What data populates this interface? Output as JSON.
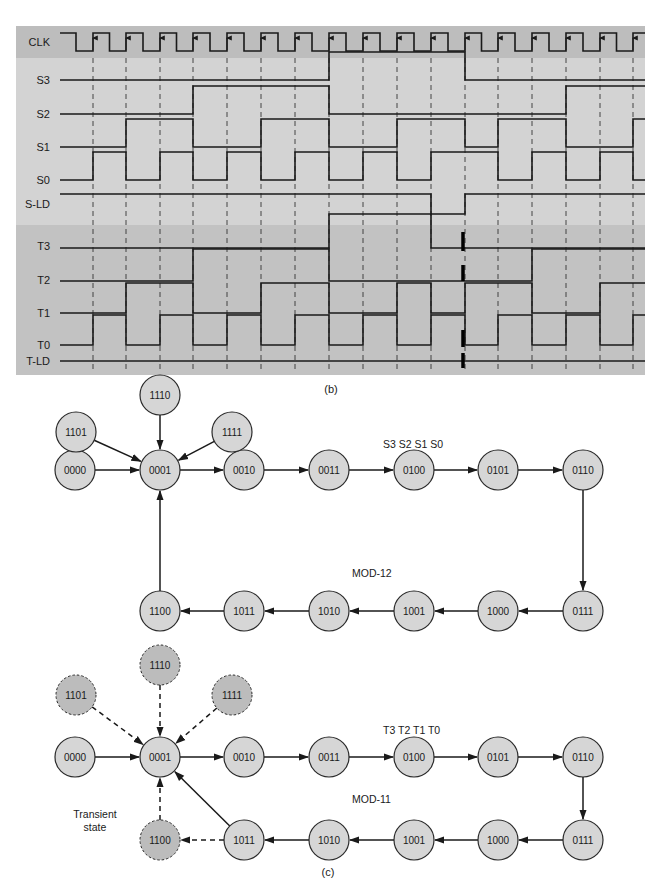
{
  "colors": {
    "clk_band": "#bdbdbd",
    "s_panel": "#d3d3d3",
    "t_panel": "#c2c2c2",
    "waveform": "#1a1a1a",
    "node_fill": "#d6d6d6",
    "invalid_node_fill": "#bcbcbc",
    "node_stroke": "#2a2a2a"
  },
  "timing": {
    "caption": "(b)",
    "clock_edges_x": [
      93,
      126,
      160,
      193,
      227,
      261,
      295,
      329,
      363,
      397,
      431,
      465,
      498,
      532,
      566,
      600,
      633
    ],
    "signals": [
      {
        "name": "CLK",
        "label_y": 42
      },
      {
        "name": "S3",
        "label_y": 80
      },
      {
        "name": "S2",
        "label_y": 114
      },
      {
        "name": "S1",
        "label_y": 147
      },
      {
        "name": "S0",
        "label_y": 180
      },
      {
        "name": "S-LD",
        "label_y": 204
      },
      {
        "name": "T3",
        "label_y": 246
      },
      {
        "name": "T2",
        "label_y": 280
      },
      {
        "name": "T1",
        "label_y": 313
      },
      {
        "name": "T0",
        "label_y": 345
      },
      {
        "name": "T-LD",
        "label_y": 361
      }
    ]
  },
  "diagram_mod12": {
    "header": "S3 S2 S1 S0",
    "label": "MOD-12",
    "nodes": [
      {
        "id": "0000",
        "x": 75,
        "y": 470
      },
      {
        "id": "0001",
        "x": 160,
        "y": 470
      },
      {
        "id": "0010",
        "x": 244,
        "y": 470
      },
      {
        "id": "0011",
        "x": 329,
        "y": 470
      },
      {
        "id": "0100",
        "x": 414,
        "y": 470
      },
      {
        "id": "0101",
        "x": 498,
        "y": 470
      },
      {
        "id": "0110",
        "x": 583,
        "y": 470
      },
      {
        "id": "0111",
        "x": 583,
        "y": 611
      },
      {
        "id": "1000",
        "x": 498,
        "y": 611
      },
      {
        "id": "1001",
        "x": 414,
        "y": 611
      },
      {
        "id": "1010",
        "x": 329,
        "y": 611
      },
      {
        "id": "1011",
        "x": 244,
        "y": 611
      },
      {
        "id": "1100",
        "x": 160,
        "y": 611
      },
      {
        "id": "1101",
        "x": 76,
        "y": 432
      },
      {
        "id": "1110",
        "x": 160,
        "y": 395
      },
      {
        "id": "1111",
        "x": 232,
        "y": 432
      }
    ]
  },
  "diagram_mod11": {
    "header": "T3 T2 T1 T0",
    "label": "MOD-11",
    "transient_label_line1": "Transient",
    "transient_label_line2": "state",
    "caption": "(c)",
    "nodes": [
      {
        "id": "0000",
        "x": 75,
        "y": 757
      },
      {
        "id": "0001",
        "x": 160,
        "y": 757
      },
      {
        "id": "0010",
        "x": 244,
        "y": 757
      },
      {
        "id": "0011",
        "x": 329,
        "y": 757
      },
      {
        "id": "0100",
        "x": 414,
        "y": 757
      },
      {
        "id": "0101",
        "x": 498,
        "y": 757
      },
      {
        "id": "0110",
        "x": 583,
        "y": 757
      },
      {
        "id": "0111",
        "x": 583,
        "y": 840
      },
      {
        "id": "1000",
        "x": 498,
        "y": 840
      },
      {
        "id": "1001",
        "x": 414,
        "y": 840
      },
      {
        "id": "1010",
        "x": 329,
        "y": 840
      },
      {
        "id": "1011",
        "x": 244,
        "y": 840
      },
      {
        "id": "1100",
        "x": 160,
        "y": 840
      },
      {
        "id": "1101",
        "x": 76,
        "y": 695
      },
      {
        "id": "1110",
        "x": 160,
        "y": 665
      },
      {
        "id": "1111",
        "x": 232,
        "y": 695
      }
    ]
  }
}
